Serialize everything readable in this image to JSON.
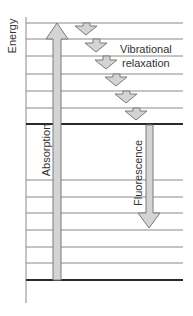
{
  "diagram": {
    "type": "jablonski-energy-diagram",
    "axis_label": "Energy",
    "labels": {
      "absorption": "Absorption",
      "fluorescence": "Fluorescence",
      "vibrational_line1": "Vibrational",
      "vibrational_line2": "relaxation"
    },
    "colors": {
      "line": "#8a8a8a",
      "thick_line": "#2a2a2a",
      "arrow_fill": "#d4d4d4",
      "arrow_stroke": "#7a7a7a",
      "text": "#333333"
    },
    "levels": {
      "excited_state_thin_y": [
        23,
        39,
        56,
        74,
        91,
        108
      ],
      "excited_state_ground_y": 124,
      "ground_state_thin_y": [
        180,
        197,
        213,
        230,
        247,
        263
      ],
      "ground_state_ground_y": 280
    },
    "vibrational_arrows_count": 6
  }
}
